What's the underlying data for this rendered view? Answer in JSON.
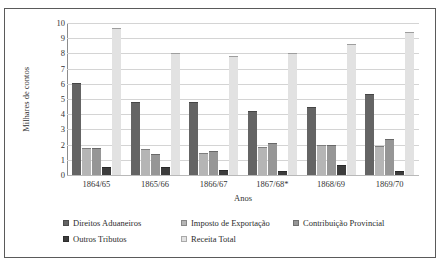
{
  "chart_data": {
    "type": "bar",
    "title": "",
    "xlabel": "Anos",
    "ylabel": "Milhares de contos",
    "ylim": [
      0,
      10
    ],
    "yticks": [
      10,
      9,
      8,
      7,
      6,
      5,
      4,
      3,
      2,
      1,
      0
    ],
    "grid": true,
    "legend_position": "bottom",
    "categories": [
      "1864/65",
      "1865/66",
      "1866/67",
      "1867/68*",
      "1868/69",
      "1869/70"
    ],
    "series": [
      {
        "name": "Direitos Aduaneiros",
        "color": "#646464",
        "values": [
          6.05,
          4.8,
          4.8,
          4.2,
          4.45,
          5.35
        ]
      },
      {
        "name": "Imposto de Exportação",
        "color": "#b5b5b5",
        "values": [
          1.8,
          1.7,
          1.45,
          1.85,
          2.0,
          1.9
        ]
      },
      {
        "name": "Contribuição Provincial",
        "color": "#969696",
        "values": [
          1.75,
          1.4,
          1.6,
          2.1,
          2.0,
          2.35
        ]
      },
      {
        "name": "Outros Tributos",
        "color": "#3c3c3c",
        "values": [
          0.55,
          0.55,
          0.35,
          0.25,
          0.65,
          0.25
        ]
      },
      {
        "name": "Receita Total",
        "color": "#e2e2e2",
        "values": [
          9.65,
          8.05,
          7.8,
          8.05,
          8.65,
          9.4
        ]
      }
    ]
  }
}
